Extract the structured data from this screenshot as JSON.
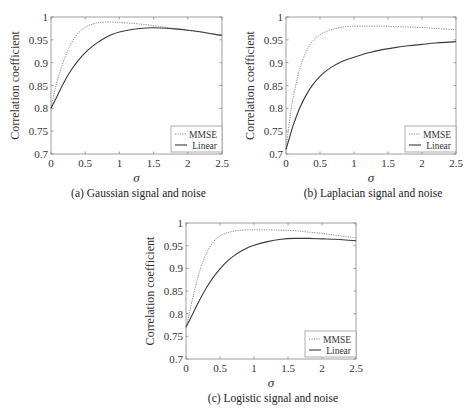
{
  "chart_data": [
    {
      "type": "line",
      "id": "a",
      "caption": "(a) Gaussian signal and noise",
      "xlabel": "σ",
      "ylabel": "Correlation coefficient",
      "xlim": [
        0,
        2.5
      ],
      "ylim": [
        0.7,
        1
      ],
      "xticks": [
        0,
        0.5,
        1,
        1.5,
        2,
        2.5
      ],
      "xtick_labels": [
        "0",
        "0.5",
        "1",
        "1.5",
        "2",
        "2.5"
      ],
      "yticks": [
        0.7,
        0.75,
        0.8,
        0.85,
        0.9,
        0.95,
        1
      ],
      "ytick_labels": [
        "0.7",
        "0.75",
        "0.8",
        "0.85",
        "0.9",
        "0.95",
        "1"
      ],
      "grid": false,
      "legend": "bottom-right",
      "x": [
        0,
        0.05,
        0.1,
        0.2,
        0.3,
        0.4,
        0.5,
        0.6,
        0.7,
        0.8,
        0.9,
        1.0,
        1.2,
        1.4,
        1.6,
        1.8,
        2.0,
        2.2,
        2.4,
        2.5
      ],
      "series": [
        {
          "name": "MMSE",
          "style": "dotted",
          "values": [
            0.8,
            0.835,
            0.865,
            0.91,
            0.943,
            0.965,
            0.977,
            0.984,
            0.988,
            0.989,
            0.989,
            0.988,
            0.986,
            0.983,
            0.979,
            0.975,
            0.971,
            0.967,
            0.962,
            0.96
          ]
        },
        {
          "name": "Linear",
          "style": "solid",
          "values": [
            0.8,
            0.815,
            0.83,
            0.86,
            0.885,
            0.905,
            0.922,
            0.935,
            0.946,
            0.955,
            0.962,
            0.967,
            0.973,
            0.976,
            0.976,
            0.974,
            0.971,
            0.967,
            0.962,
            0.96
          ]
        }
      ]
    },
    {
      "type": "line",
      "id": "b",
      "caption": "(b) Laplacian signal and noise",
      "xlabel": "σ",
      "ylabel": "Correlation coefficient",
      "xlim": [
        0,
        2.5
      ],
      "ylim": [
        0.7,
        1
      ],
      "xticks": [
        0,
        0.5,
        1,
        1.5,
        2,
        2.5
      ],
      "xtick_labels": [
        "0",
        "0.5",
        "1",
        "1.5",
        "2",
        "2.5"
      ],
      "yticks": [
        0.7,
        0.75,
        0.8,
        0.85,
        0.9,
        0.95,
        1
      ],
      "ytick_labels": [
        "0.7",
        "0.75",
        "0.8",
        "0.85",
        "0.9",
        "0.95",
        "1"
      ],
      "grid": false,
      "legend": "bottom-right",
      "x": [
        0,
        0.05,
        0.1,
        0.2,
        0.3,
        0.4,
        0.5,
        0.6,
        0.7,
        0.8,
        0.9,
        1.0,
        1.2,
        1.4,
        1.6,
        1.8,
        2.0,
        2.2,
        2.4,
        2.5
      ],
      "series": [
        {
          "name": "MMSE",
          "style": "dotted",
          "values": [
            0.71,
            0.77,
            0.82,
            0.885,
            0.925,
            0.948,
            0.961,
            0.969,
            0.974,
            0.977,
            0.979,
            0.98,
            0.98,
            0.98,
            0.979,
            0.978,
            0.977,
            0.975,
            0.973,
            0.972
          ]
        },
        {
          "name": "Linear",
          "style": "solid",
          "values": [
            0.71,
            0.735,
            0.76,
            0.8,
            0.83,
            0.853,
            0.87,
            0.883,
            0.893,
            0.901,
            0.907,
            0.912,
            0.921,
            0.928,
            0.933,
            0.937,
            0.94,
            0.943,
            0.945,
            0.946
          ]
        }
      ]
    },
    {
      "type": "line",
      "id": "c",
      "caption": "(c) Logistic signal and noise",
      "xlabel": "σ",
      "ylabel": "Correlation coefficient",
      "xlim": [
        0,
        2.5
      ],
      "ylim": [
        0.7,
        1
      ],
      "xticks": [
        0,
        0.5,
        1,
        1.5,
        2,
        2.5
      ],
      "xtick_labels": [
        "0",
        "0.5",
        "1",
        "1.5",
        "2",
        "2.5"
      ],
      "yticks": [
        0.7,
        0.75,
        0.8,
        0.85,
        0.9,
        0.95,
        1
      ],
      "ytick_labels": [
        "0.7",
        "0.75",
        "0.8",
        "0.85",
        "0.9",
        "0.95",
        "1"
      ],
      "grid": false,
      "legend": "bottom-right",
      "x": [
        0,
        0.05,
        0.1,
        0.2,
        0.3,
        0.4,
        0.5,
        0.6,
        0.7,
        0.8,
        0.9,
        1.0,
        1.2,
        1.4,
        1.6,
        1.8,
        2.0,
        2.2,
        2.4,
        2.5
      ],
      "series": [
        {
          "name": "MMSE",
          "style": "dotted",
          "values": [
            0.77,
            0.8,
            0.835,
            0.893,
            0.933,
            0.958,
            0.971,
            0.978,
            0.982,
            0.984,
            0.985,
            0.985,
            0.985,
            0.984,
            0.983,
            0.98,
            0.977,
            0.973,
            0.969,
            0.967
          ]
        },
        {
          "name": "Linear",
          "style": "solid",
          "values": [
            0.77,
            0.785,
            0.8,
            0.83,
            0.857,
            0.88,
            0.899,
            0.915,
            0.927,
            0.937,
            0.945,
            0.951,
            0.959,
            0.964,
            0.966,
            0.966,
            0.965,
            0.964,
            0.962,
            0.961
          ]
        }
      ]
    }
  ]
}
